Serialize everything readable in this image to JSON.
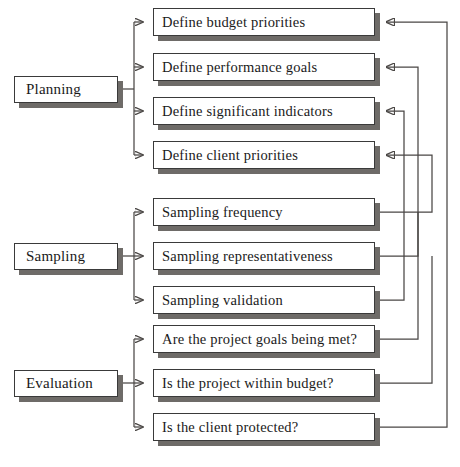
{
  "diagram": {
    "type": "flow-diagram",
    "background_color": "#ffffff",
    "box_border_color": "#3a3a3a",
    "box_fill_color": "#ffffff",
    "shadow_color": "#6e6b68",
    "connector_color": "#4a4745"
  },
  "phases": [
    {
      "id": "planning",
      "label": "Planning"
    },
    {
      "id": "sampling",
      "label": "Sampling"
    },
    {
      "id": "evaluation",
      "label": "Evaluation"
    }
  ],
  "tasks": {
    "planning": [
      {
        "id": "define-budget-priorities",
        "label": "Define budget priorities"
      },
      {
        "id": "define-performance-goals",
        "label": "Define performance goals"
      },
      {
        "id": "define-significant-indicators",
        "label": "Define significant indicators"
      },
      {
        "id": "define-client-priorities",
        "label": "Define client priorities"
      }
    ],
    "sampling": [
      {
        "id": "sampling-frequency",
        "label": "Sampling frequency"
      },
      {
        "id": "sampling-representativeness",
        "label": "Sampling representativeness"
      },
      {
        "id": "sampling-validation",
        "label": "Sampling validation"
      }
    ],
    "evaluation": [
      {
        "id": "project-goals-met",
        "label": "Are the project goals being met?"
      },
      {
        "id": "project-within-budget",
        "label": "Is the project within budget?"
      },
      {
        "id": "client-protected",
        "label": "Is the client protected?"
      }
    ]
  },
  "feedback_links": [
    {
      "from": "sampling-frequency",
      "to": "define-client-priorities"
    },
    {
      "from": "sampling-representativeness",
      "to": "define-performance-goals"
    },
    {
      "from": "sampling-validation",
      "to": "define-significant-indicators"
    },
    {
      "from": "project-goals-met",
      "to": "define-client-priorities"
    },
    {
      "from": "project-within-budget",
      "to": "define-performance-goals"
    },
    {
      "from": "client-protected",
      "to": "define-budget-priorities"
    }
  ]
}
